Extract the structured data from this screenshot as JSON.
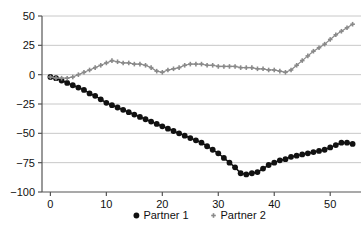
{
  "chart_data": {
    "type": "line",
    "title": "",
    "subtitle": "",
    "xlabel": "",
    "ylabel": "",
    "xlim": [
      -1.5,
      55.5
    ],
    "ylim": [
      -100,
      50
    ],
    "xticks": [
      0,
      10,
      20,
      30,
      40,
      50
    ],
    "yticks": [
      -100,
      -75,
      -50,
      -25,
      0,
      25,
      50
    ],
    "xtick_labels": [
      "0",
      "10",
      "20",
      "30",
      "40",
      "50"
    ],
    "ytick_labels": [
      "-100",
      "-75",
      "-50",
      "-25",
      "0",
      "25",
      "50"
    ],
    "grid": "horizontal",
    "legend_position": "bottom-center",
    "colors": {
      "partner1": "#111111",
      "partner2": "#8a8a8a",
      "grid": "#c8c8c8",
      "axis": "#555555",
      "background": "#ffffff"
    },
    "x": [
      0,
      1,
      2,
      3,
      4,
      5,
      6,
      7,
      8,
      9,
      10,
      11,
      12,
      13,
      14,
      15,
      16,
      17,
      18,
      19,
      20,
      21,
      22,
      23,
      24,
      25,
      26,
      27,
      28,
      29,
      30,
      31,
      32,
      33,
      34,
      35,
      36,
      37,
      38,
      39,
      40,
      41,
      42,
      43,
      44,
      45,
      46,
      47,
      48,
      49,
      50,
      51,
      52,
      53,
      54
    ],
    "series": [
      {
        "name": "Partner 1",
        "marker": "circle",
        "color": "#111111",
        "values": [
          -2,
          -3,
          -5,
          -7,
          -9,
          -11,
          -13,
          -16,
          -18,
          -21,
          -24,
          -26,
          -28,
          -30,
          -32,
          -34,
          -36,
          -38,
          -40,
          -42,
          -44,
          -46,
          -48,
          -50,
          -52,
          -54,
          -56,
          -58,
          -61,
          -64,
          -67,
          -71,
          -75,
          -79,
          -84,
          -85,
          -84,
          -83,
          -80,
          -77,
          -75,
          -73,
          -72,
          -70,
          -69,
          -68,
          -67,
          -66,
          -65,
          -64,
          -62,
          -60,
          -58,
          -58,
          -59
        ]
      },
      {
        "name": "Partner 2",
        "marker": "plus",
        "color": "#8a8a8a",
        "values": [
          -2,
          -3,
          -3,
          -3,
          -2,
          0,
          2,
          4,
          6,
          8,
          10,
          12,
          11,
          10,
          10,
          9,
          9,
          8,
          6,
          3,
          2,
          4,
          5,
          6,
          8,
          9,
          9,
          9,
          8,
          8,
          7,
          7,
          7,
          7,
          6,
          6,
          6,
          5,
          5,
          4,
          4,
          3,
          2,
          4,
          8,
          12,
          16,
          20,
          23,
          26,
          30,
          34,
          37,
          40,
          43
        ]
      }
    ]
  },
  "legend": {
    "items": [
      {
        "label": "Partner 1",
        "marker": "circle",
        "color": "#111111"
      },
      {
        "label": "Partner 2",
        "marker": "plus",
        "color": "#8a8a8a"
      }
    ]
  }
}
